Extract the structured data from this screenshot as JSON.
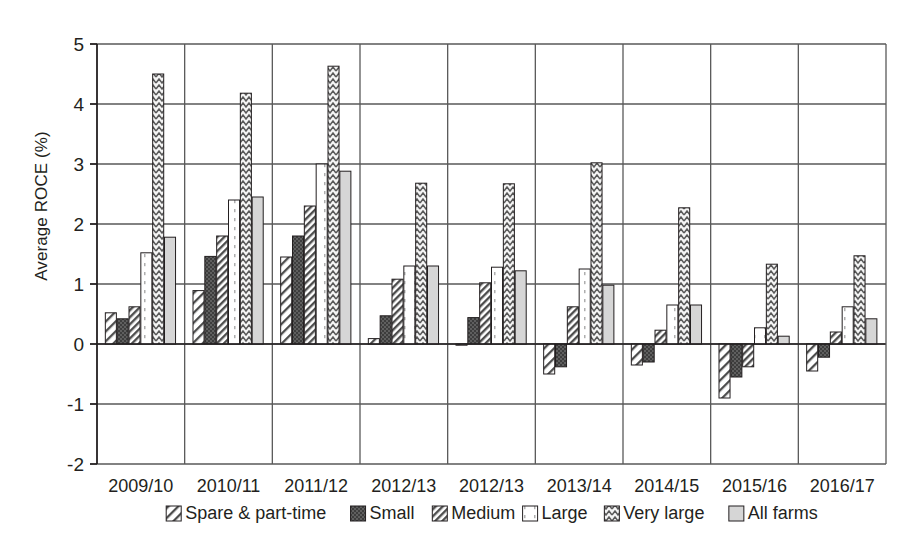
{
  "chart_data": {
    "type": "bar",
    "title": "",
    "subtitle": "",
    "xlabel": "",
    "ylabel": "Average ROCE (%)",
    "ylim": [
      -2,
      5
    ],
    "yticks": [
      -2,
      -1,
      0,
      1,
      2,
      3,
      4,
      5
    ],
    "ytick_labels": [
      "-2",
      "-1",
      "0",
      "1",
      "2",
      "3",
      "4",
      "5"
    ],
    "grid": true,
    "grid_axis": "both",
    "legend_position": "bottom",
    "orientation": "vertical",
    "categories": [
      "2009/10",
      "2010/11",
      "2011/12",
      "2012/13",
      "2012/13",
      "2013/14",
      "2014/15",
      "2015/16",
      "2016/17"
    ],
    "series": [
      {
        "name": "Spare & part-time",
        "fill": "diagonal-hatch-light",
        "color": "#ffffff",
        "values": [
          0.52,
          0.89,
          1.45,
          0.09,
          -0.02,
          -0.5,
          -0.35,
          -0.9,
          -0.45
        ]
      },
      {
        "name": "Small",
        "fill": "dark-checker",
        "color": "#595959",
        "values": [
          0.42,
          1.46,
          1.8,
          0.47,
          0.44,
          -0.38,
          -0.3,
          -0.55,
          -0.22
        ]
      },
      {
        "name": "Medium",
        "fill": "dense-diagonal-hatch",
        "color": "#ffffff",
        "values": [
          0.62,
          1.8,
          2.3,
          1.08,
          1.02,
          0.62,
          0.23,
          -0.38,
          0.2
        ]
      },
      {
        "name": "Large",
        "fill": "solid-white",
        "color": "#ffffff",
        "values": [
          1.52,
          2.4,
          3.0,
          1.3,
          1.28,
          1.25,
          0.65,
          0.27,
          0.62
        ]
      },
      {
        "name": "Very large",
        "fill": "zigzag-wave",
        "color": "#f2f2f2",
        "values": [
          4.5,
          4.18,
          4.63,
          2.68,
          2.67,
          3.02,
          2.27,
          1.33,
          1.47
        ]
      },
      {
        "name": "All farms",
        "fill": "solid-grey",
        "color": "#d4d4d4",
        "values": [
          1.78,
          2.45,
          2.88,
          1.3,
          1.22,
          0.98,
          0.65,
          0.13,
          0.42
        ]
      }
    ]
  },
  "axis": {
    "y_title": "Average ROCE (%)"
  },
  "colors": {
    "axis_line": "#231f20",
    "grid_line": "#595959",
    "text": "#231f20",
    "background": "#ffffff"
  }
}
